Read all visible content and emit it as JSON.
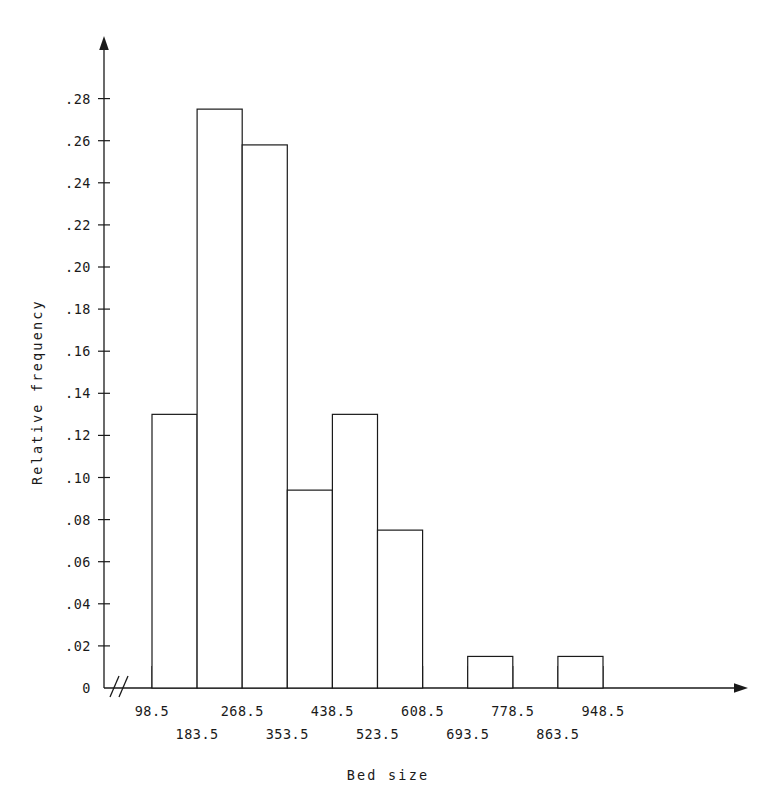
{
  "chart_data": {
    "type": "bar",
    "title": "",
    "xlabel": "Bed size",
    "ylabel": "Relative frequency",
    "grid": false,
    "legend": null,
    "axis_break": "//",
    "bin_width": 85,
    "bin_edges": [
      98.5,
      183.5,
      268.5,
      353.5,
      438.5,
      523.5,
      608.5,
      693.5,
      778.5,
      863.5,
      948.5
    ],
    "categories": [
      "98.5-183.5",
      "183.5-268.5",
      "268.5-353.5",
      "353.5-438.5",
      "438.5-523.5",
      "523.5-608.5",
      "608.5-693.5",
      "693.5-778.5",
      "778.5-863.5",
      "863.5-948.5"
    ],
    "values": [
      0.13,
      0.275,
      0.258,
      0.094,
      0.13,
      0.075,
      0.0,
      0.015,
      0.0,
      0.015
    ],
    "xlim": [
      98.5,
      1010
    ],
    "ylim": [
      0,
      0.295
    ],
    "xtick_values": [
      98.5,
      183.5,
      268.5,
      353.5,
      438.5,
      523.5,
      608.5,
      693.5,
      778.5,
      863.5,
      948.5
    ],
    "xtick_labels_upper": [
      "98.5",
      "",
      "268.5",
      "",
      "438.5",
      "",
      "608.5",
      "",
      "778.5",
      "",
      "948.5"
    ],
    "xtick_labels_lower": [
      "",
      "183.5",
      "",
      "353.5",
      "",
      "523.5",
      "",
      "693.5",
      "",
      "863.5",
      ""
    ],
    "ytick_values": [
      0,
      0.02,
      0.04,
      0.06,
      0.08,
      0.1,
      0.12,
      0.14,
      0.16,
      0.18,
      0.2,
      0.22,
      0.24,
      0.26,
      0.28
    ],
    "ytick_labels": [
      "0",
      ".02",
      ".04",
      ".06",
      ".08",
      ".10",
      ".12",
      ".14",
      ".16",
      ".18",
      ".20",
      ".22",
      ".24",
      ".26",
      ".28"
    ],
    "line_color": "#1a1a1a",
    "bar_fill": "#ffffff",
    "background": "#ffffff"
  }
}
